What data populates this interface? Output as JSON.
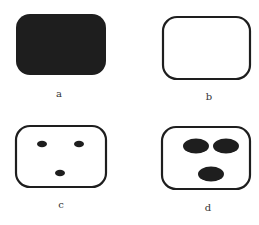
{
  "figure": {
    "panels": [
      {
        "id": "a",
        "label": "a",
        "shape": "rounded-rectangle",
        "style": "filled",
        "spots": 0
      },
      {
        "id": "b",
        "label": "b",
        "shape": "rounded-rectangle",
        "style": "outline",
        "spots": 0
      },
      {
        "id": "c",
        "label": "c",
        "shape": "rounded-rectangle",
        "style": "outline",
        "spots": 3,
        "spot_size": "small"
      },
      {
        "id": "d",
        "label": "d",
        "shape": "rounded-rectangle",
        "style": "outline",
        "spots": 3,
        "spot_size": "large"
      }
    ],
    "colors": {
      "ink": "#1e1e1e",
      "paper": "#ffffff",
      "label": "#333333"
    }
  }
}
